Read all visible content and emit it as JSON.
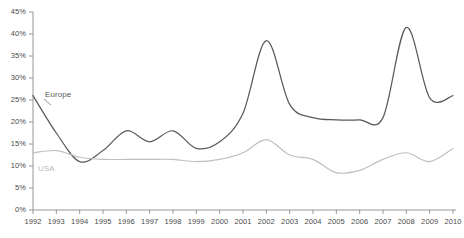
{
  "chart_data": {
    "type": "line",
    "title": "",
    "subtitle": "",
    "xlabel": "",
    "ylabel": "",
    "x": [
      1992,
      1993,
      1994,
      1995,
      1996,
      1997,
      1998,
      1999,
      2000,
      2001,
      2002,
      2003,
      2004,
      2005,
      2006,
      2007,
      2008,
      2009,
      2010
    ],
    "categories": [
      "1992",
      "1993",
      "1994",
      "1995",
      "1996",
      "1997",
      "1998",
      "1999",
      "2000",
      "2001",
      "2002",
      "2003",
      "2004",
      "2005",
      "2006",
      "2007",
      "2008",
      "2009",
      "2010"
    ],
    "xlim": [
      1992,
      2010
    ],
    "ylim": [
      0,
      45
    ],
    "y_ticks": [
      0,
      5,
      10,
      15,
      20,
      25,
      30,
      35,
      40,
      45
    ],
    "y_tick_labels": [
      "0%",
      "5%",
      "10%",
      "15%",
      "20%",
      "25%",
      "30%",
      "35%",
      "40%",
      "45%"
    ],
    "y_unit": "%",
    "grid": false,
    "legend": "inline-labels",
    "series": [
      {
        "name": "Europe",
        "color": "#5a5a5a",
        "values": [
          26.0,
          17.5,
          11.0,
          13.5,
          18.0,
          15.5,
          18.0,
          14.0,
          15.5,
          22.0,
          38.5,
          24.0,
          21.0,
          20.5,
          20.5,
          21.0,
          41.5,
          25.5,
          26.0
        ]
      },
      {
        "name": "USA",
        "color": "#bfbfbf",
        "values": [
          13.0,
          13.5,
          12.0,
          11.5,
          11.5,
          11.5,
          11.5,
          11.0,
          11.5,
          13.0,
          16.0,
          12.5,
          11.5,
          8.5,
          9.0,
          11.5,
          13.0,
          11.0,
          14.0
        ]
      }
    ],
    "annotations": [
      {
        "text": "Europe",
        "series": "Europe",
        "x": 1993,
        "y": 27
      },
      {
        "text": "USA",
        "series": "USA",
        "x": 1992.5,
        "y": 10
      }
    ]
  }
}
